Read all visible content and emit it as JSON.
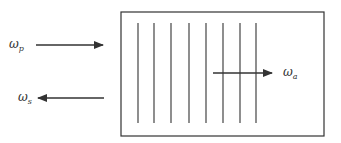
{
  "diagram": {
    "labels": {
      "pump": {
        "base": "ω",
        "sub": "p"
      },
      "stokes": {
        "base": "ω",
        "sub": "s"
      },
      "acoustic": {
        "base": "ω",
        "sub": "a"
      }
    },
    "grating_lines": 8,
    "colors": {
      "stroke": "#333333",
      "background": "#ffffff"
    }
  }
}
